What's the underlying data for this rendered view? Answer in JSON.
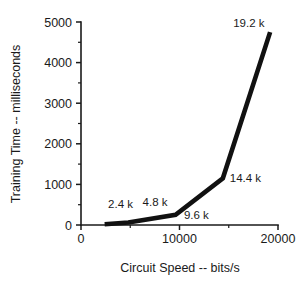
{
  "chart_data": {
    "type": "line",
    "title": "",
    "xlabel": "Circuit Speed -- bits/s",
    "ylabel": "Training Time -- milliseconds",
    "xlim": [
      0,
      20000
    ],
    "ylim": [
      0,
      5000
    ],
    "grid": false,
    "legend": null,
    "x": [
      2400,
      4800,
      9600,
      14400,
      19200
    ],
    "values": [
      20,
      60,
      250,
      1150,
      4750
    ],
    "series": [
      {
        "name": "Training Time",
        "color": "#111111",
        "x": [
          2400,
          4800,
          9600,
          14400,
          19200
        ],
        "values": [
          20,
          60,
          250,
          1150,
          4750
        ]
      }
    ],
    "xticks": [
      0,
      10000,
      20000
    ],
    "xtick_labels": [
      "0",
      "10000",
      "20000"
    ],
    "xticks_minor": [
      5000,
      15000
    ],
    "yticks": [
      0,
      1000,
      2000,
      3000,
      4000,
      5000
    ],
    "ytick_labels": [
      "0",
      "1000",
      "2000",
      "3000",
      "4000",
      "5000"
    ],
    "yticks_minor": [
      500,
      1500,
      2500,
      3500,
      4500
    ],
    "annotations": [
      {
        "text": "2.4 k",
        "x": 2400,
        "y": 20,
        "label_x": 2750,
        "label_y": 430
      },
      {
        "text": "4.8 k",
        "x": 4800,
        "y": 60,
        "label_x": 6250,
        "label_y": 470
      },
      {
        "text": "9.6 k",
        "x": 9600,
        "y": 250,
        "label_x": 10450,
        "label_y": 150
      },
      {
        "text": "14.4 k",
        "x": 14400,
        "y": 1150,
        "label_x": 15100,
        "label_y": 1050
      },
      {
        "text": "19.2 k",
        "x": 19200,
        "y": 4750,
        "label_x": 15450,
        "label_y": 4880
      }
    ]
  }
}
